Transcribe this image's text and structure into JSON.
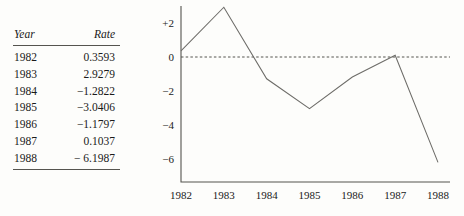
{
  "table": {
    "headers": {
      "year": "Year",
      "rate": "Rate"
    },
    "rows": [
      {
        "year": "1982",
        "rate": "0.3593"
      },
      {
        "year": "1983",
        "rate": "2.9279"
      },
      {
        "year": "1984",
        "rate": "−1.2822"
      },
      {
        "year": "1985",
        "rate": "−3.0406"
      },
      {
        "year": "1986",
        "rate": "−1.1797"
      },
      {
        "year": "1987",
        "rate": "0.1037"
      },
      {
        "year": "1988",
        "rate": "− 6.1987"
      }
    ]
  },
  "chart_data": {
    "type": "line",
    "title": "",
    "xlabel": "",
    "ylabel": "",
    "x": [
      "1982",
      "1983",
      "1984",
      "1985",
      "1986",
      "1987",
      "1988"
    ],
    "values": [
      0.3593,
      2.9279,
      -1.2822,
      -3.0406,
      -1.1797,
      0.1037,
      -6.1987
    ],
    "series": [
      {
        "name": "Rate",
        "values": [
          0.3593,
          2.9279,
          -1.2822,
          -3.0406,
          -1.1797,
          0.1037,
          -6.1987
        ]
      }
    ],
    "ylim": [
      -7.0,
      3.4
    ],
    "yticks": [
      2,
      0,
      -2,
      -4,
      -6
    ],
    "ytick_labels": [
      "+2",
      "0",
      "−2",
      "−4",
      "−6"
    ],
    "xtick_labels": [
      "1982",
      "1983",
      "1984",
      "1985",
      "1986",
      "1987",
      "1988"
    ],
    "grid": false,
    "legend": "none",
    "zero_reference_line": 0,
    "line_color": "#6d6c68",
    "axis_color": "#55544f",
    "text_color": "#1a1a1a",
    "background": "#fdfdfb"
  }
}
